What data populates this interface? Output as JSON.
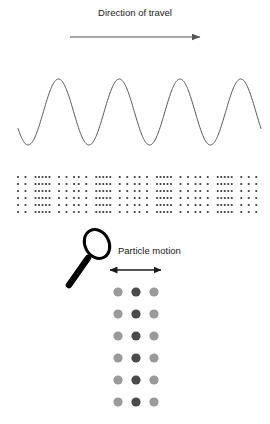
{
  "figure": {
    "width": 270,
    "height": 424,
    "background": "#ffffff",
    "ink": "#1a1a1a"
  },
  "travel": {
    "label": "Direction of travel",
    "arrow_name": "direction-of-travel-arrow",
    "arrow_x_start": 70,
    "arrow_x_end": 200,
    "arrow_y": 37
  },
  "particle": {
    "label": "Particle motion",
    "arrow_name": "particle-motion-arrow",
    "arrow_x_start": 110,
    "arrow_x_end": 161,
    "arrow_y": 270
  },
  "magnifier": {
    "name": "magnifying-glass-icon",
    "lens_cx": 97,
    "lens_cy": 244,
    "lens_rx": 12,
    "lens_ry": 15,
    "lens_rotation": -28,
    "handle_x1": 88,
    "handle_y1": 258,
    "handle_x2": 69,
    "handle_y2": 285,
    "color": "#000000"
  },
  "chart_data": {
    "type": "line",
    "xlabel": "",
    "ylabel": "",
    "grid": false,
    "legend": "none",
    "wave": {
      "name": "sine-wave-curve",
      "cycles": 4,
      "x_start": 18,
      "x_end": 261,
      "wavelength": 60.75,
      "amplitude": 33,
      "midline_y": 112,
      "peak_y": 79,
      "trough_y": 145,
      "phase_start_deg": 210,
      "stroke": "#555555",
      "stroke_width": 1
    },
    "dot_field": {
      "name": "longitudinal-dot-field",
      "description": "Four repeating compression/rarefaction groups of particle dots",
      "rows": 6,
      "groups": 4,
      "group_width": 60.75,
      "x_origin": 18,
      "y_top": 177,
      "row_spacing": 7,
      "dot_radius": 1.1,
      "color": "#3a3a3a",
      "column_offsets": [
        0,
        7.5,
        17.5,
        21,
        24.5,
        28,
        31.5,
        41,
        48.5,
        56
      ],
      "column_density_note": "sparse outer columns, dense central compression band"
    },
    "particle_grid": {
      "name": "particle-motion-grid",
      "columns": 3,
      "rows": 6,
      "x_positions": [
        118,
        136,
        154
      ],
      "y_start": 292,
      "row_spacing": 22,
      "dot_radius": 4.6,
      "colors": [
        "#9a9a9a",
        "#4a4a4a",
        "#9a9a9a"
      ],
      "center_column_index": 1
    }
  }
}
